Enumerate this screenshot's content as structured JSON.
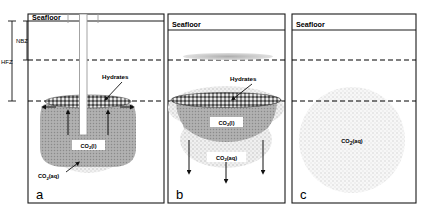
{
  "figure": {
    "type": "schematic-diagram",
    "panel_count": 3
  },
  "zone_brackets": [
    {
      "id": "nbz",
      "label": "NBZ",
      "name": "negative-buoyancy-zone",
      "top_y": 21,
      "bottom_y": 60
    },
    {
      "id": "hfz",
      "label": "HFZ",
      "name": "hydrate-formation-zone",
      "top_y": 21,
      "bottom_y": 101
    }
  ],
  "colors": {
    "frame": "#1a1a1a",
    "seafloor_line": "#1a1a1a",
    "dashed_line": "#000000",
    "hydrate_fill": "#8d8d8d",
    "co2_liquid_fill": "#a8a8a8",
    "co2_aqueous_fill": "#d8d8d8",
    "plume_fill": "#b4b4b4",
    "well_casing": "#ffffff",
    "well_outline": "#9a9a9a",
    "panel_bg": "#ffffff"
  },
  "panels": [
    {
      "id": "a",
      "letter": "a",
      "name": "panel-a-well-injection",
      "x": 28,
      "y": 14,
      "width": 136,
      "height": 189,
      "seafloor_label": "Seafloor",
      "seafloor_line_y": 21,
      "dashed_lines_y": [
        60,
        101
      ],
      "features": {
        "well": {
          "present": true,
          "label": "injection-well",
          "x": 80,
          "top_y": 14,
          "bottom_y": 135,
          "width": 7
        },
        "hydrate_cap": {
          "present": true,
          "label": "Hydrates",
          "center_x": 88,
          "center_y": 102,
          "rx": 42,
          "ry": 7
        },
        "co2_liquid": {
          "present": true,
          "label": "CO2(l)",
          "label_html": "CO<sub>2</sub>(l)",
          "center_x": 88,
          "center_y": 133,
          "rx": 42,
          "ry": 33
        },
        "co2_aqueous": {
          "present": true,
          "label": "CO2(aq)",
          "label_html": "CO<sub>2</sub>(aq)",
          "label_x": 48,
          "label_y": 174
        },
        "arrows_up_count": 2,
        "arrows_lateral_count": 2,
        "arrows_down_count": 0
      }
    },
    {
      "id": "b",
      "letter": "b",
      "name": "panel-b-hydrate-cap-leakage",
      "x": 168,
      "y": 14,
      "width": 117,
      "height": 189,
      "seafloor_label": "Seafloor",
      "seafloor_line_y": 30,
      "dashed_lines_y": [
        60,
        101
      ],
      "features": {
        "well": {
          "present": false
        },
        "upper_lens": {
          "present": true,
          "center_x": 228,
          "center_y": 56,
          "rx": 44,
          "ry": 4
        },
        "hydrate_cap": {
          "present": true,
          "label": "Hydrates",
          "center_x": 226,
          "center_y": 101,
          "rx": 54,
          "ry": 8
        },
        "co2_liquid": {
          "present": true,
          "label": "CO2(l)",
          "label_html": "CO<sub>2</sub>(l)",
          "center_x": 226,
          "center_y": 122
        },
        "co2_aqueous": {
          "present": true,
          "label": "CO2(aq)",
          "label_html": "CO<sub>2</sub>(aq)",
          "label_x": 226,
          "label_y": 158
        },
        "arrows_up_count": 0,
        "arrows_lateral_count": 0,
        "arrows_down_count": 3,
        "plumes_count": 2
      }
    },
    {
      "id": "c",
      "letter": "c",
      "name": "panel-c-dissolved-plume",
      "x": 292,
      "y": 14,
      "width": 124,
      "height": 189,
      "seafloor_label": "Seafloor",
      "seafloor_line_y": 30,
      "dashed_lines_y": [
        60,
        101
      ],
      "features": {
        "well": {
          "present": false
        },
        "hydrate_cap": {
          "present": false
        },
        "co2_liquid": {
          "present": false
        },
        "co2_aqueous": {
          "present": true,
          "label": "CO2(aq)",
          "label_html": "CO<sub>2</sub>(aq)",
          "center_x": 352,
          "center_y": 140,
          "radius": 52,
          "label_x": 352,
          "label_y": 142
        },
        "arrows_up_count": 0,
        "arrows_lateral_count": 0,
        "arrows_down_count": 0
      }
    }
  ],
  "callouts": {
    "hydrates": "Hydrates",
    "co2_liquid": "CO2(l)",
    "co2_aqueous": "CO2(aq)",
    "seafloor": "Seafloor"
  }
}
